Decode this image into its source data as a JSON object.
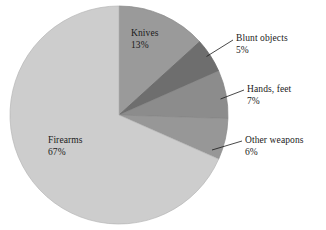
{
  "chart_data": {
    "type": "pie",
    "title": "",
    "categories": [
      "Knives",
      "Blunt objects",
      "Hands, feet",
      "Other weapons",
      "Firearms"
    ],
    "values": [
      13,
      5,
      7,
      6,
      67
    ],
    "value_unit": "%",
    "legend": "none",
    "grid": false,
    "slices": [
      {
        "label": "Knives",
        "value": 13,
        "value_text": "13%",
        "color": "#9a9a9a",
        "label_position": "inside"
      },
      {
        "label": "Blunt objects",
        "value": 5,
        "value_text": "5%",
        "color": "#6e6e6e",
        "label_position": "outside-right"
      },
      {
        "label": "Hands, feet",
        "value": 7,
        "value_text": "7%",
        "color": "#8c8c8c",
        "label_position": "outside-right"
      },
      {
        "label": "Other weapons",
        "value": 6,
        "value_text": "6%",
        "color": "#979797",
        "label_position": "outside-right"
      },
      {
        "label": "Firearms",
        "value": 67,
        "value_text": "67%",
        "color": "#cdcdcd",
        "label_position": "inside"
      }
    ],
    "background_color": "#ffffff",
    "text_color": "#1a1a1a",
    "outline_color": "#8f8f8f"
  }
}
